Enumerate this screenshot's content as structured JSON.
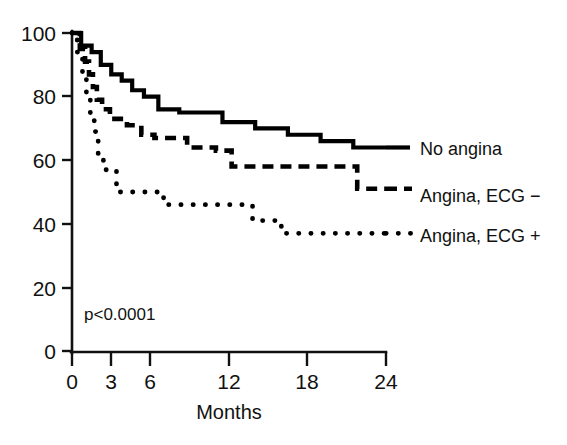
{
  "chart_data": {
    "type": "line",
    "title": "",
    "subtitle": "",
    "xlabel": "Months",
    "ylabel": "",
    "xlim": [
      0,
      24
    ],
    "ylim": [
      0,
      100
    ],
    "xticks": [
      0,
      3,
      6,
      12,
      18,
      24
    ],
    "xtick_labels": [
      "0",
      "3",
      "6",
      "12",
      "18",
      "24"
    ],
    "yticks": [
      0,
      20,
      40,
      60,
      80,
      100
    ],
    "ytick_labels": [
      "0",
      "20",
      "40",
      "60",
      "80",
      "100"
    ],
    "grid": false,
    "legend_position": "right",
    "annotations": [
      {
        "text": "p<0.0001",
        "x": 0.8,
        "y": 9
      }
    ],
    "series": [
      {
        "name": "No angina",
        "style": "solid",
        "color": "#000000",
        "x": [
          0,
          0.7,
          0.7,
          1.5,
          1.5,
          2.2,
          2.2,
          3.0,
          3.0,
          3.8,
          3.8,
          4.6,
          4.6,
          5.5,
          5.5,
          6.6,
          6.6,
          8.2,
          8.2,
          11.5,
          11.5,
          14.0,
          14.0,
          16.5,
          16.5,
          19.0,
          19.0,
          21.5,
          21.5,
          24.0
        ],
        "y": [
          100,
          100,
          96,
          96,
          94,
          94,
          90,
          90,
          87,
          87,
          85,
          85,
          82,
          82,
          80,
          80,
          76,
          76,
          75,
          75,
          72,
          72,
          70,
          70,
          68,
          68,
          66,
          66,
          64,
          64
        ]
      },
      {
        "name": "Angina, ECG −",
        "style": "dashed",
        "color": "#000000",
        "x": [
          0,
          0.6,
          0.6,
          1.0,
          1.0,
          1.3,
          1.3,
          1.6,
          1.6,
          1.9,
          1.9,
          2.3,
          2.3,
          2.9,
          2.9,
          4.2,
          4.2,
          5.3,
          5.3,
          6.3,
          6.3,
          8.8,
          8.8,
          11.0,
          11.0,
          12.2,
          12.2,
          21.8,
          21.8,
          24.0
        ],
        "y": [
          100,
          100,
          95,
          95,
          91,
          91,
          87,
          87,
          83,
          83,
          79,
          79,
          76,
          76,
          73,
          73,
          71,
          71,
          68,
          68,
          67,
          67,
          64,
          64,
          63,
          63,
          58,
          58,
          51,
          51
        ]
      },
      {
        "name": "Angina, ECG +",
        "style": "dotted",
        "color": "#000000",
        "x": [
          0,
          0.4,
          0.4,
          0.8,
          0.8,
          1.1,
          1.1,
          1.4,
          1.4,
          1.7,
          1.7,
          2.0,
          2.0,
          2.4,
          2.4,
          3.4,
          3.4,
          4.6,
          4.6,
          7.0,
          7.0,
          10.6,
          10.6,
          13.8,
          13.8,
          16.0,
          16.0,
          24.0
        ],
        "y": [
          100,
          100,
          94,
          94,
          87,
          87,
          80,
          80,
          74,
          74,
          69,
          69,
          61,
          61,
          57,
          57,
          50,
          50,
          50,
          50,
          46,
          46,
          46,
          46,
          41,
          41,
          37,
          37
        ]
      }
    ]
  },
  "legend": {
    "entries": [
      {
        "label": "No angina",
        "style": "solid"
      },
      {
        "label": "Angina, ECG −",
        "style": "dashed"
      },
      {
        "label": "Angina, ECG +",
        "style": "dotted"
      }
    ]
  },
  "axes": {
    "x_title": "Months",
    "y_title": ""
  },
  "statistics": {
    "p_value_text": "p<0.0001"
  }
}
